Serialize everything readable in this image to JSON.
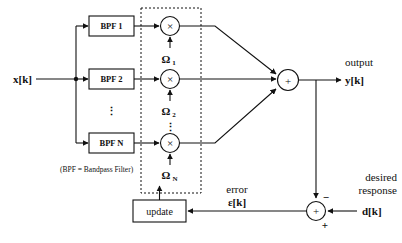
{
  "diagram": {
    "title_caption": "(BPF = Bandpass Filter)",
    "input_label": "x[k]",
    "output_label_top": "output",
    "output_label_bottom": "y[k]",
    "desired_label_top": "desired",
    "desired_label_bottom": "response",
    "desired_signal": "d[k]",
    "error_label_top": "error",
    "error_label_bottom": "ε[k]",
    "update_label": "update",
    "sum_symbol": "+",
    "mult_symbol": "×",
    "vertical_ellipsis": "⋮",
    "sign_minus": "−",
    "sign_plus": "+",
    "filters": [
      {
        "label": "BPF 1"
      },
      {
        "label": "BPF 2"
      },
      {
        "label": "BPF N"
      }
    ],
    "weights": [
      {
        "symbol": "Ω",
        "subscript": "1"
      },
      {
        "symbol": "Ω",
        "subscript": "2"
      },
      {
        "symbol": "Ω",
        "subscript": "N"
      }
    ],
    "colors": {
      "ink": "#111111",
      "paper": "#ffffff"
    }
  }
}
